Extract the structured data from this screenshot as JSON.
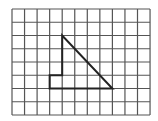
{
  "grid": {
    "columns": 11,
    "rows": 8,
    "left": 12,
    "top": 9,
    "cell_width": 12.55,
    "cell_height": 13.25,
    "line_color": "#555555",
    "line_width": 1.2
  },
  "shape": {
    "name": "polygon-on-grid",
    "stroke_color": "#222222",
    "stroke_width": 2,
    "vertices": [
      [
        4,
        2
      ],
      [
        4,
        5
      ],
      [
        3,
        5
      ],
      [
        3,
        6
      ],
      [
        8,
        6
      ]
    ]
  }
}
